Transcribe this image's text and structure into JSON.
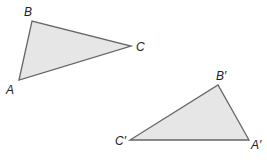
{
  "figure": {
    "colors": {
      "fill": "#e6e6e6",
      "stroke": "#666666",
      "label": "#222222"
    },
    "triangles": [
      {
        "name": "ABC",
        "vertices": [
          {
            "label": "A",
            "x": 19,
            "y": 80,
            "lx": 6,
            "ly": 94
          },
          {
            "label": "B",
            "x": 32,
            "y": 21,
            "lx": 24,
            "ly": 16
          },
          {
            "label": "C",
            "x": 131,
            "y": 46,
            "lx": 136,
            "ly": 51
          }
        ]
      },
      {
        "name": "A'B'C'",
        "vertices": [
          {
            "label": "A′",
            "x": 249,
            "y": 140,
            "lx": 251,
            "ly": 149
          },
          {
            "label": "B′",
            "x": 218,
            "y": 85,
            "lx": 216,
            "ly": 80
          },
          {
            "label": "C′",
            "x": 130,
            "y": 140,
            "lx": 115,
            "ly": 145
          }
        ]
      }
    ]
  }
}
